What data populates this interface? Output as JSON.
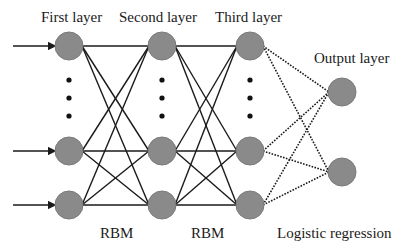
{
  "labels": {
    "first_layer": "First layer",
    "second_layer": "Second layer",
    "third_layer": "Third layer",
    "output_layer": "Output layer",
    "rbm_1": "RBM",
    "rbm_2": "RBM",
    "logistic_regression": "Logistic regression"
  },
  "colors": {
    "node_fill": "#8a8a8a",
    "node_stroke": "#7a7a7a",
    "edge": "#1a1a1a",
    "background": "#ffffff"
  },
  "layers": [
    {
      "name": "first",
      "x": 69,
      "nodes_y": [
        46,
        151,
        205
      ],
      "ellipsis": true
    },
    {
      "name": "second",
      "x": 162,
      "nodes_y": [
        46,
        151,
        205
      ],
      "ellipsis": true
    },
    {
      "name": "third",
      "x": 250,
      "nodes_y": [
        46,
        151,
        205
      ],
      "ellipsis": true
    },
    {
      "name": "output",
      "x": 342,
      "nodes_y": [
        92,
        172
      ],
      "ellipsis": false
    }
  ],
  "node_radius": 14,
  "ellipsis_dots_y": [
    80,
    98,
    116
  ],
  "inputs": {
    "x_start": 13,
    "count": 3
  },
  "connections": [
    {
      "from": 0,
      "to": 1,
      "style": "solid",
      "label": "RBM"
    },
    {
      "from": 1,
      "to": 2,
      "style": "solid",
      "label": "RBM"
    },
    {
      "from": 2,
      "to": 3,
      "style": "dotted",
      "label": "Logistic regression"
    }
  ]
}
